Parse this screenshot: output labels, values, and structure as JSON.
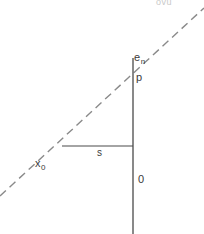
{
  "figure": {
    "title_fragment": "ovu",
    "background_color": "#ffffff",
    "line_color": "#4a4a4a",
    "dashed_line_color": "#8a8a8a",
    "text_color": "#3a3a3a",
    "width": 204,
    "height": 234,
    "labels": {
      "en_base": "e",
      "en_sub": "n",
      "p": "p",
      "s": "s",
      "x_base": "x",
      "x_sub": "0",
      "zero": "0"
    },
    "geometry": {
      "dashed_line": {
        "x1": 0,
        "y1": 196,
        "x2": 204,
        "y2": 8
      },
      "vertical_line": {
        "x1": 133,
        "y1": 58,
        "x2": 133,
        "y2": 234
      },
      "horizontal_line": {
        "x1": 62,
        "y1": 146,
        "x2": 133,
        "y2": 146
      }
    }
  }
}
